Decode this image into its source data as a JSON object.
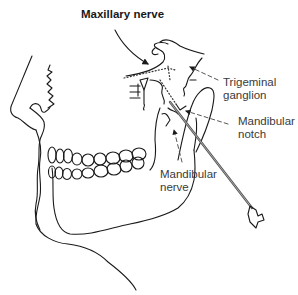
{
  "figure": {
    "labels": {
      "maxillary_nerve": "Maxillary nerve",
      "trigeminal_ganglion_line1": "Trigeminal",
      "trigeminal_ganglion_line2": "ganglion",
      "mandibular_notch_line1": "Mandibular",
      "mandibular_notch_line2": "notch",
      "mandibular_nerve_line1": "Mandibular",
      "mandibular_nerve_line2": "nerve"
    },
    "icons": [
      "skull-profile-drawing",
      "needle-syringe-icon"
    ],
    "colors": {
      "line": "#1a1a1a",
      "label_text": "#3a3a3a",
      "background": "#ffffff"
    }
  }
}
